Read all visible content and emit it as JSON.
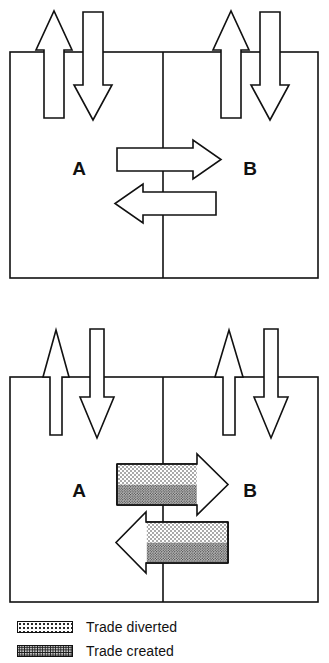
{
  "figure": {
    "title": "",
    "panels": [
      {
        "name": "upper-panel",
        "regions": [
          {
            "label": "A",
            "side": "left"
          },
          {
            "label": "B",
            "side": "right"
          }
        ],
        "vertical_arrows": [
          {
            "region": "A",
            "direction": "up",
            "style": "outline",
            "width": "wide"
          },
          {
            "region": "A",
            "direction": "down",
            "style": "outline",
            "width": "wide"
          },
          {
            "region": "B",
            "direction": "up",
            "style": "outline",
            "width": "wide"
          },
          {
            "region": "B",
            "direction": "down",
            "style": "outline",
            "width": "wide"
          }
        ],
        "horizontal_arrows": [
          {
            "direction": "right",
            "from": "A",
            "to": "B",
            "style": "outline"
          },
          {
            "direction": "left",
            "from": "B",
            "to": "A",
            "style": "outline"
          }
        ]
      },
      {
        "name": "lower-panel",
        "regions": [
          {
            "label": "A",
            "side": "left"
          },
          {
            "label": "B",
            "side": "right"
          }
        ],
        "vertical_arrows": [
          {
            "region": "A",
            "direction": "up",
            "style": "outline",
            "width": "narrow"
          },
          {
            "region": "A",
            "direction": "down",
            "style": "outline",
            "width": "narrow"
          },
          {
            "region": "B",
            "direction": "up",
            "style": "outline",
            "width": "narrow"
          },
          {
            "region": "B",
            "direction": "down",
            "style": "outline",
            "width": "narrow"
          }
        ],
        "horizontal_arrows": [
          {
            "direction": "right",
            "from": "A",
            "to": "B",
            "style": "shaded",
            "bands": [
              "Trade diverted",
              "Trade created"
            ]
          },
          {
            "direction": "left",
            "from": "B",
            "to": "A",
            "style": "shaded",
            "bands": [
              "Trade diverted",
              "Trade created"
            ]
          }
        ]
      }
    ]
  },
  "labels": {
    "upper_left": "A",
    "upper_right": "B",
    "lower_left": "A",
    "lower_right": "B"
  },
  "legend": {
    "items": [
      {
        "key": "diverted",
        "label": "Trade diverted",
        "pattern": "sparse-dots"
      },
      {
        "key": "created",
        "label": "Trade created",
        "pattern": "dense-stipple"
      }
    ]
  },
  "colors": {
    "stroke": "#111111",
    "fill": "#ffffff",
    "diverted_fill": "#ffffff",
    "created_fill": "#c9c9c9",
    "background": "#ffffff",
    "text": "#111111"
  }
}
